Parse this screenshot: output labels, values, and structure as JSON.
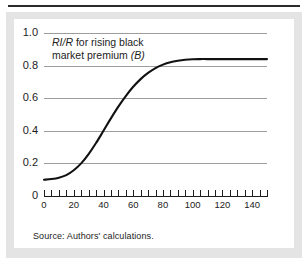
{
  "figure": {
    "source_note": "Source: Authors' calculations.",
    "panel_bg": "#ffffff",
    "frame_bg": "#e4e4e4",
    "rule_color": "#2b2b2b"
  },
  "chart_data": {
    "type": "line",
    "title": "",
    "annotation": {
      "line1_italic": "RI/R",
      "line1_rest": " for rising black",
      "line2_rest": "market premium ",
      "line2_italic": "(B)",
      "full_text": "RI/R for rising black market premium (B)"
    },
    "xlabel": "",
    "ylabel": "",
    "xlim": [
      0,
      150
    ],
    "ylim": [
      0,
      1.0
    ],
    "grid": true,
    "legend": "none",
    "xticks": [
      0,
      20,
      40,
      60,
      80,
      100,
      120,
      140
    ],
    "xtick_labels": [
      "0",
      "20",
      "40",
      "60",
      "80",
      "100",
      "120",
      "140"
    ],
    "xminor_tick_step": 5,
    "yticks": [
      0,
      0.2,
      0.4,
      0.6,
      0.8,
      1.0
    ],
    "ytick_labels": [
      "0",
      "0.2",
      "0.4",
      "0.6",
      "0.8",
      "1.0"
    ],
    "series": [
      {
        "name": "RI/R for rising black market premium (B)",
        "color": "#111111",
        "x": [
          0,
          5,
          10,
          15,
          20,
          25,
          30,
          35,
          40,
          45,
          50,
          55,
          60,
          65,
          70,
          75,
          80,
          85,
          90,
          95,
          100,
          105,
          110,
          120,
          130,
          140,
          150
        ],
        "values": [
          0.1,
          0.104,
          0.112,
          0.128,
          0.158,
          0.2,
          0.257,
          0.325,
          0.4,
          0.476,
          0.548,
          0.613,
          0.67,
          0.717,
          0.755,
          0.785,
          0.806,
          0.821,
          0.83,
          0.836,
          0.839,
          0.84,
          0.84,
          0.84,
          0.84,
          0.84,
          0.84
        ]
      }
    ]
  }
}
